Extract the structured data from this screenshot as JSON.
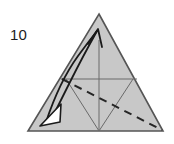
{
  "figure": {
    "name": "origami-fold-step",
    "step_label": "10",
    "colors": {
      "background": "#ffffff",
      "paper_fill": "#c8c8c8",
      "paper_stroke": "#555555",
      "crease_stroke": "#6a6a6a",
      "arrow_stroke": "#1a1a1a",
      "arrowhead_fill": "#ffffff",
      "label_text": "#1d1d1d"
    },
    "shape": {
      "kind": "triangle",
      "apex": [
        99,
        14
      ],
      "bottom_left": [
        28,
        131
      ],
      "bottom_right": [
        163,
        131
      ]
    },
    "creases": [
      {
        "name": "horizontal-crease",
        "kind": "solid",
        "from": [
          61,
          79
        ],
        "to": [
          137,
          79
        ]
      },
      {
        "name": "center-vertical-crease",
        "kind": "solid",
        "from": [
          99,
          40
        ],
        "to": [
          99,
          131
        ]
      },
      {
        "name": "left-diagonal-crease",
        "kind": "solid",
        "from": [
          66,
          79
        ],
        "to": [
          99,
          131
        ]
      },
      {
        "name": "right-diagonal-crease",
        "kind": "solid",
        "from": [
          133,
          79
        ],
        "to": [
          99,
          131
        ]
      }
    ],
    "fold_lines": [
      {
        "name": "valley-fold-dashed-line",
        "kind": "dashed",
        "from": [
          62,
          79
        ],
        "to": [
          162,
          130
        ]
      }
    ],
    "arrows": [
      {
        "name": "fold-arrow-up",
        "kind": "curved-arrow",
        "tail": [
          45,
          123
        ],
        "head": [
          98,
          30
        ],
        "head_style": "open-v"
      },
      {
        "name": "fold-arrow-down-left",
        "kind": "hollow-arrowhead",
        "tip": [
          44,
          123
        ],
        "head_style": "hollow-triangle"
      }
    ]
  }
}
